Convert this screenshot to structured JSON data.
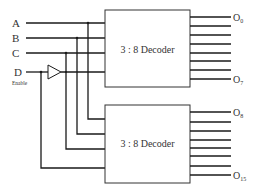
{
  "diagram": {
    "type": "logic-circuit",
    "colors": {
      "line": "#1a1a1a",
      "box": "#333333",
      "text": "#333333",
      "background": "#ffffff"
    },
    "inputs": [
      {
        "id": "A",
        "label": "A"
      },
      {
        "id": "B",
        "label": "B"
      },
      {
        "id": "C",
        "label": "C"
      },
      {
        "id": "D",
        "label": "D",
        "sublabel": "Enable"
      }
    ],
    "decoders": [
      {
        "id": "top",
        "label": "3 : 8 Decoder",
        "out_first": "O",
        "out_first_sub": "0",
        "out_last": "O",
        "out_last_sub": "7",
        "output_count": 8
      },
      {
        "id": "bottom",
        "label": "3 : 8 Decoder",
        "out_first": "O",
        "out_first_sub": "8",
        "out_last": "O",
        "out_last_sub": "15",
        "output_count": 8
      }
    ],
    "buffer": {
      "label": "buffer/inverter",
      "input": "D",
      "feeds": "top decoder enable"
    }
  }
}
